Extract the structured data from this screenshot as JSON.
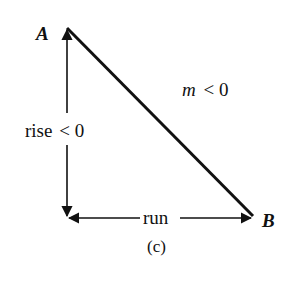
{
  "figure": {
    "caption": "(c)",
    "stroke_color": "#111111",
    "background": "#ffffff"
  },
  "points": {
    "A": {
      "label": "A",
      "x": 67,
      "y": 28
    },
    "corner": {
      "x": 67,
      "y": 218
    },
    "B": {
      "label": "B",
      "x": 253,
      "y": 218
    }
  },
  "labels": {
    "rise": "rise",
    "rise_relation": "< 0",
    "run": "run",
    "slope_var": "m",
    "slope_relation": "< 0"
  }
}
